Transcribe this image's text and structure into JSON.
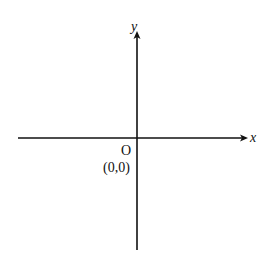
{
  "diagram": {
    "type": "cartesian-axes",
    "axes": {
      "x": {
        "label": "x",
        "direction": "right",
        "arrow": true
      },
      "y": {
        "label": "y",
        "direction": "up",
        "arrow": true
      }
    },
    "origin": {
      "label": "O",
      "coordinates": "(0,0)"
    },
    "colors": {
      "line": "#111111",
      "background": "#ffffff"
    }
  }
}
